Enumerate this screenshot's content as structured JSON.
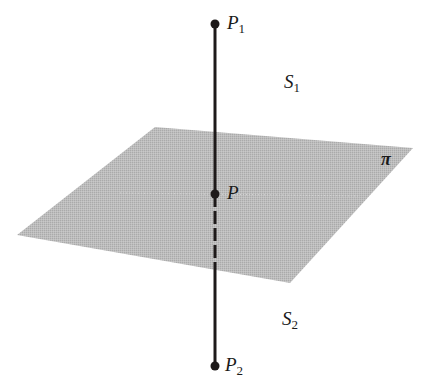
{
  "diagram": {
    "type": "line-through-plane",
    "colors": {
      "background": "#ffffff",
      "plane_fill": "#b9b9b9",
      "line": "#1e1a1a",
      "dotted_line": "#d8d8d8",
      "text": "#1a1a1a"
    },
    "plane": {
      "label": "π",
      "vertices": [
        [
          155,
          127
        ],
        [
          413,
          148
        ],
        [
          290,
          283
        ],
        [
          17,
          235
        ]
      ]
    },
    "line": {
      "x": 215,
      "y_top": 24,
      "y_bottom": 366
    },
    "points": {
      "P1": {
        "name": "P",
        "sub": "1",
        "x": 215,
        "y": 24
      },
      "P": {
        "name": "P",
        "sub": "",
        "x": 215,
        "y": 194
      },
      "P2": {
        "name": "P",
        "sub": "2",
        "x": 215,
        "y": 366
      }
    },
    "regions": {
      "S1": {
        "name": "S",
        "sub": "1"
      },
      "S2": {
        "name": "S",
        "sub": "2"
      }
    }
  }
}
